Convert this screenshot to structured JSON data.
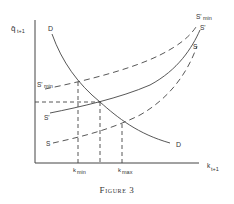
{
  "figure": {
    "caption": "Figure 3",
    "axes": {
      "y_label": "q̂",
      "y_label_sub": "t+1",
      "x_label": "k",
      "x_label_sub": "t+1"
    },
    "curves": {
      "D": {
        "label": "D",
        "style": "solid"
      },
      "S_prime_min": {
        "label": "S'",
        "label_sub": "min",
        "style": "dashed"
      },
      "S_prime": {
        "label": "S'",
        "style": "solid"
      },
      "S": {
        "label": "S",
        "style": "dashed"
      }
    },
    "ticks": {
      "k_min": {
        "label": "k",
        "label_sub": "min"
      },
      "k_max": {
        "label": "k",
        "label_sub": "max"
      }
    },
    "colors": {
      "ink": "#333333",
      "background": "#ffffff"
    }
  }
}
